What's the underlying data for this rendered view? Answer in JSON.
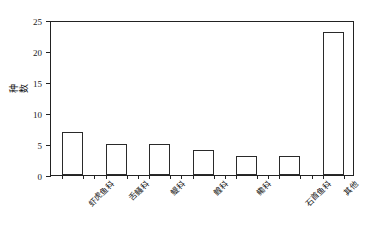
{
  "chart_data": {
    "type": "bar",
    "title": "",
    "xlabel": "",
    "ylabel": "种数",
    "categories": [
      "虾虎鱼科",
      "舌鳋科",
      "鳀科",
      "鳇科",
      "鳓科",
      "石首鱼科",
      "其他"
    ],
    "values": [
      7,
      5,
      5,
      4,
      3,
      3,
      23
    ],
    "ylim": [
      0,
      25
    ],
    "yticks": [
      0,
      5,
      10,
      15,
      20,
      25
    ],
    "ytick_labels": [
      "0",
      "5",
      "10",
      "15",
      "20",
      "25"
    ],
    "grid": false,
    "legend": false,
    "legend_position": "none",
    "bar_facecolor": "#ffffff",
    "bar_edgecolor": "#2a2a2a",
    "axis_color": "#222222",
    "background": "#ffffff"
  }
}
